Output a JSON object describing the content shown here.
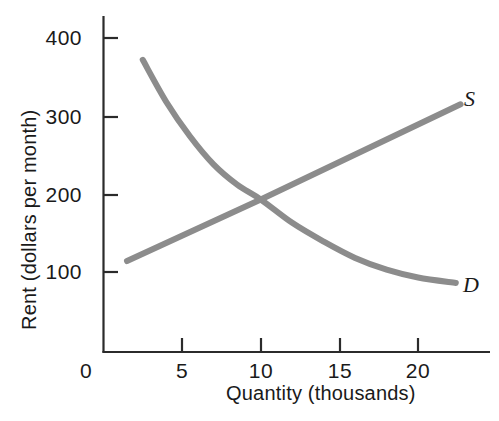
{
  "chart_data": {
    "type": "line",
    "title": "",
    "xlabel": "Quantity (thousands)",
    "ylabel": "Rent (dollars per month)",
    "xlim": [
      0,
      24
    ],
    "ylim": [
      0,
      440
    ],
    "grid": false,
    "legend_position": "inline-curve-end",
    "xticks": [
      {
        "value": 0,
        "label": "0"
      },
      {
        "value": 5,
        "label": "5"
      },
      {
        "value": 10,
        "label": "10"
      },
      {
        "value": 15,
        "label": "15"
      },
      {
        "value": 20,
        "label": "20"
      }
    ],
    "yticks": [
      {
        "value": 100,
        "label": "100"
      },
      {
        "value": 200,
        "label": "200"
      },
      {
        "value": 300,
        "label": "300"
      },
      {
        "value": 400,
        "label": "400"
      }
    ],
    "series": [
      {
        "name": "D",
        "label": "D",
        "description": "Demand curve, downward sloping and convex to the origin",
        "color": "#8c8c8c",
        "points": [
          {
            "x": 2.5,
            "y": 372
          },
          {
            "x": 4.0,
            "y": 318
          },
          {
            "x": 5.5,
            "y": 274
          },
          {
            "x": 7.0,
            "y": 238
          },
          {
            "x": 8.5,
            "y": 212
          },
          {
            "x": 10.0,
            "y": 193
          },
          {
            "x": 12.0,
            "y": 163
          },
          {
            "x": 14.0,
            "y": 139
          },
          {
            "x": 16.0,
            "y": 118
          },
          {
            "x": 18.0,
            "y": 103
          },
          {
            "x": 20.0,
            "y": 93
          },
          {
            "x": 22.4,
            "y": 86
          }
        ]
      },
      {
        "name": "S",
        "label": "S",
        "description": "Supply curve, upward sloping straight line",
        "color": "#8c8c8c",
        "points": [
          {
            "x": 1.5,
            "y": 114
          },
          {
            "x": 10.0,
            "y": 193
          },
          {
            "x": 22.7,
            "y": 315
          }
        ]
      }
    ],
    "annotations": [
      {
        "name": "equilibrium",
        "x": 10,
        "y": 193,
        "label": ""
      }
    ]
  },
  "axis": {
    "origin_label": "0",
    "y_axis_title": "Rent (dollars per month)",
    "x_axis_title": "Quantity (thousands)"
  },
  "curve_labels": {
    "supply": "S",
    "demand": "D"
  },
  "colors": {
    "curve": "#8c8c8c",
    "axis": "#2b2b2b",
    "text": "#1a1a1a",
    "background": "#ffffff"
  }
}
